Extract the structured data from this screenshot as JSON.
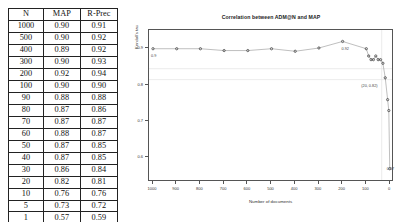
{
  "table": {
    "headers": [
      "N",
      "MAP",
      "R-Prec"
    ],
    "rows": [
      {
        "n": "1000",
        "map": "0.90",
        "rprec": "0.91"
      },
      {
        "n": "500",
        "map": "0.90",
        "rprec": "0.92"
      },
      {
        "n": "400",
        "map": "0.89",
        "rprec": "0.92"
      },
      {
        "n": "300",
        "map": "0.90",
        "rprec": "0.93"
      },
      {
        "n": "200",
        "map": "0.92",
        "rprec": "0.94"
      },
      {
        "n": "100",
        "map": "0.90",
        "rprec": "0.90"
      },
      {
        "n": "90",
        "map": "0.88",
        "rprec": "0.88"
      },
      {
        "n": "80",
        "map": "0.87",
        "rprec": "0.86"
      },
      {
        "n": "70",
        "map": "0.87",
        "rprec": "0.87"
      },
      {
        "n": "60",
        "map": "0.88",
        "rprec": "0.87"
      },
      {
        "n": "50",
        "map": "0.87",
        "rprec": "0.85"
      },
      {
        "n": "40",
        "map": "0.87",
        "rprec": "0.85"
      },
      {
        "n": "30",
        "map": "0.86",
        "rprec": "0.84"
      },
      {
        "n": "20",
        "map": "0.82",
        "rprec": "0.81"
      },
      {
        "n": "10",
        "map": "0.76",
        "rprec": "0.76"
      },
      {
        "n": "5",
        "map": "0.73",
        "rprec": "0.72"
      },
      {
        "n": "1",
        "map": "0.57",
        "rprec": "0.59"
      }
    ]
  },
  "chart_data": {
    "type": "line",
    "title": "Correlation between ADM@N and MAP",
    "xlabel": "Number of documents",
    "ylabel": "Kendall's tau",
    "xlim": [
      1000,
      0
    ],
    "ylim": [
      0.55,
      0.935
    ],
    "x_ticks": [
      1000,
      900,
      800,
      700,
      600,
      500,
      400,
      300,
      200,
      100,
      0
    ],
    "y_ticks": [
      0.9,
      0.8,
      0.7,
      0.6
    ],
    "x_reversed": true,
    "grid": false,
    "legend": "none",
    "x": [
      1000,
      900,
      800,
      700,
      600,
      500,
      400,
      300,
      200,
      100,
      90,
      80,
      70,
      60,
      50,
      40,
      30,
      20,
      10,
      5,
      1
    ],
    "values": [
      0.9,
      0.9,
      0.9,
      0.895,
      0.895,
      0.9,
      0.893,
      0.902,
      0.92,
      0.9,
      0.88,
      0.87,
      0.87,
      0.88,
      0.87,
      0.87,
      0.86,
      0.82,
      0.76,
      0.73,
      0.57
    ],
    "annotations": [
      {
        "label": "0.9",
        "x": 1000,
        "y": 0.9
      },
      {
        "label": "0.92",
        "x": 200,
        "y": 0.92
      },
      {
        "label": "(20, 0.82)",
        "x": 20,
        "y": 0.82
      },
      {
        "label": "0.57",
        "x": 1,
        "y": 0.57
      }
    ]
  }
}
